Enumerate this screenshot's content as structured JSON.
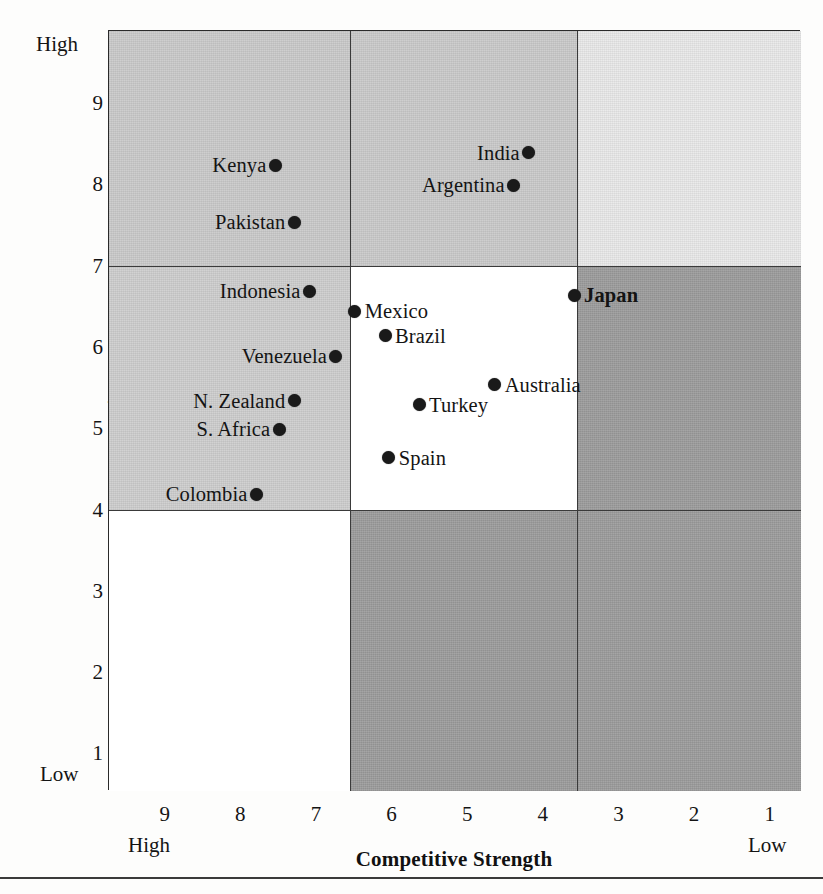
{
  "axes": {
    "y_title": "Country Attractiveness",
    "y_high_label": "High",
    "y_low_label": "Low",
    "y_ticks": [
      "9",
      "8",
      "7",
      "6",
      "5",
      "4",
      "3",
      "2",
      "1"
    ],
    "x_title": "Competitive Strength",
    "x_high_label": "High",
    "x_low_label": "Low",
    "x_ticks": [
      "9",
      "8",
      "7",
      "6",
      "5",
      "4",
      "3",
      "2",
      "1"
    ]
  },
  "colors": {
    "shade_light": "#cfcfcf",
    "shade_lighter": "#e6e6e6",
    "shade_dark": "#9a9a9a",
    "white": "#ffffff",
    "point": "#1a1a1a",
    "border": "#3a3a3a"
  },
  "cells": [
    {
      "name": "cell-top-left",
      "row": 0,
      "col": 0,
      "fill": "#cbcbcb"
    },
    {
      "name": "cell-top-center",
      "row": 0,
      "col": 1,
      "fill": "#cbcbcb"
    },
    {
      "name": "cell-top-right",
      "row": 0,
      "col": 2,
      "fill": "#eaeaea"
    },
    {
      "name": "cell-middle-left",
      "row": 1,
      "col": 0,
      "fill": "#cfcfcf"
    },
    {
      "name": "cell-middle-center",
      "row": 1,
      "col": 1,
      "fill": "#ffffff"
    },
    {
      "name": "cell-middle-right",
      "row": 1,
      "col": 2,
      "fill": "#9d9d9d"
    },
    {
      "name": "cell-bottom-left",
      "row": 2,
      "col": 0,
      "fill": "#ffffff"
    },
    {
      "name": "cell-bottom-center",
      "row": 2,
      "col": 1,
      "fill": "#9d9d9d"
    },
    {
      "name": "cell-bottom-right",
      "row": 2,
      "col": 2,
      "fill": "#9d9d9d"
    }
  ],
  "chart_data": {
    "type": "scatter",
    "title": "",
    "xlabel": "Competitive Strength",
    "ylabel": "Country Attractiveness",
    "xlim": [
      9.75,
      0.6
    ],
    "ylim": [
      0.55,
      9.9
    ],
    "x_axis_reversed": true,
    "grid": false,
    "legend": false,
    "x_tick_labels": [
      "9",
      "8",
      "7",
      "6",
      "5",
      "4",
      "3",
      "2",
      "1"
    ],
    "y_tick_labels": [
      "9",
      "8",
      "7",
      "6",
      "5",
      "4",
      "3",
      "2",
      "1"
    ],
    "x_endpoint_labels": {
      "left": "High",
      "right": "Low"
    },
    "y_endpoint_labels": {
      "top": "High",
      "bottom": "Low"
    },
    "quadrant_dividers": {
      "x": [
        6.55,
        3.55
      ],
      "y": [
        7.0,
        4.0
      ]
    },
    "points": [
      {
        "name": "Kenya",
        "x": 7.55,
        "y": 8.25,
        "label_side": "left",
        "bold": false
      },
      {
        "name": "Pakistan",
        "x": 7.3,
        "y": 7.55,
        "label_side": "left",
        "bold": false
      },
      {
        "name": "India",
        "x": 4.2,
        "y": 8.4,
        "label_side": "left",
        "bold": false
      },
      {
        "name": "Argentina",
        "x": 4.4,
        "y": 8.0,
        "label_side": "left",
        "bold": false
      },
      {
        "name": "Indonesia",
        "x": 7.1,
        "y": 6.7,
        "label_side": "left",
        "bold": false
      },
      {
        "name": "Mexico",
        "x": 6.5,
        "y": 6.45,
        "label_side": "right",
        "bold": false
      },
      {
        "name": "Brazil",
        "x": 6.1,
        "y": 6.15,
        "label_side": "right",
        "bold": false
      },
      {
        "name": "Japan",
        "x": 3.6,
        "y": 6.65,
        "label_side": "right",
        "bold": true
      },
      {
        "name": "Venezuela",
        "x": 6.75,
        "y": 5.9,
        "label_side": "left",
        "bold": false
      },
      {
        "name": "Australia",
        "x": 4.65,
        "y": 5.55,
        "label_side": "right",
        "bold": false
      },
      {
        "name": "N. Zealand",
        "x": 7.3,
        "y": 5.35,
        "label_side": "left",
        "bold": false
      },
      {
        "name": "Turkey",
        "x": 5.65,
        "y": 5.3,
        "label_side": "right",
        "bold": false
      },
      {
        "name": "S. Africa",
        "x": 7.5,
        "y": 5.0,
        "label_side": "left",
        "bold": false
      },
      {
        "name": "Spain",
        "x": 6.05,
        "y": 4.65,
        "label_side": "right",
        "bold": false
      },
      {
        "name": "Colombia",
        "x": 7.8,
        "y": 4.2,
        "label_side": "left",
        "bold": false
      }
    ]
  }
}
